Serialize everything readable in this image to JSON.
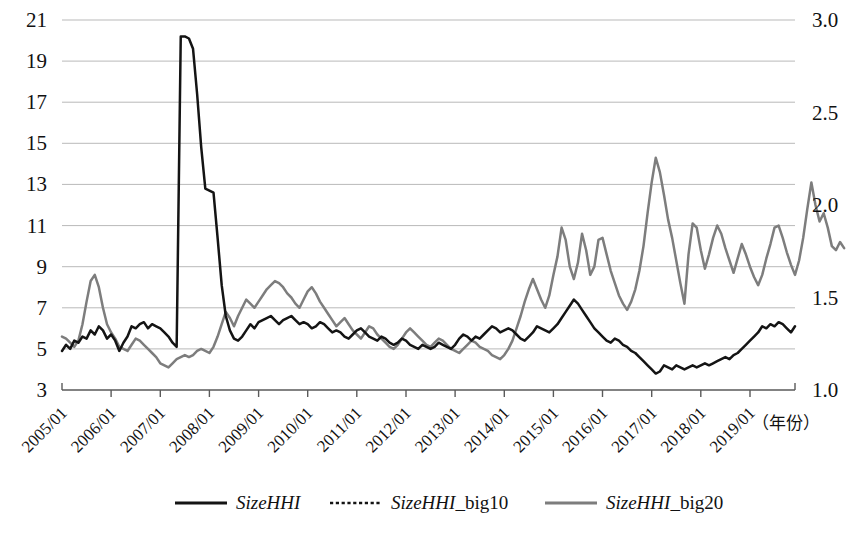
{
  "chart_data": {
    "type": "line",
    "title": "",
    "xlabel": "（年份）",
    "ylabel": "",
    "grid": true,
    "legend_position": "bottom",
    "x_tick_labels": [
      "2005/01",
      "2006/01",
      "2007/01",
      "2008/01",
      "2009/01",
      "2010/01",
      "2011/01",
      "2012/01",
      "2013/01",
      "2014/01",
      "2015/01",
      "2016/01",
      "2017/01",
      "2018/01",
      "2019/01"
    ],
    "left_axis": {
      "label": "",
      "ticks": [
        3,
        5,
        7,
        9,
        11,
        13,
        15,
        17,
        19,
        21
      ],
      "tick_labels": [
        "3",
        "5",
        "7",
        "9",
        "11",
        "13",
        "15",
        "17",
        "19",
        "21"
      ],
      "ylim": [
        3,
        21
      ],
      "applies_to": [
        "SizeHHI",
        "SizeHHI_big20"
      ]
    },
    "right_axis": {
      "label": "",
      "ticks": [
        1.0,
        1.5,
        2.0,
        2.5,
        3.0
      ],
      "tick_labels": [
        "1.0",
        "1.5",
        "2.0",
        "2.5",
        "3.0"
      ],
      "ylim": [
        1.0,
        3.0
      ],
      "applies_to": [
        "SizeHHI_big10"
      ]
    },
    "legend": [
      {
        "name": "SizeHHI",
        "name_italic": "SizeHHI",
        "name_suffix": "",
        "style": "solid",
        "color": "#141414"
      },
      {
        "name": "SizeHHI_big10",
        "name_italic": "SizeHHI",
        "name_suffix": "_big10",
        "style": "dotted",
        "color": "#141414"
      },
      {
        "name": "SizeHHI_big20",
        "name_italic": "SizeHHI",
        "name_suffix": "_big20",
        "style": "solid",
        "color": "#7d7d7d"
      }
    ],
    "x_start": "2005/01",
    "x_end": "2019/12",
    "n_points": 180,
    "series": [
      {
        "name": "SizeHHI",
        "axis": "left",
        "style": "solid",
        "color": "#141414",
        "values": [
          4.9,
          5.2,
          5.0,
          5.4,
          5.3,
          5.6,
          5.5,
          5.9,
          5.7,
          6.1,
          5.9,
          5.5,
          5.7,
          5.4,
          4.9,
          5.3,
          5.6,
          6.1,
          6.0,
          6.2,
          6.3,
          6.0,
          6.2,
          6.1,
          6.0,
          5.8,
          5.6,
          5.3,
          5.1,
          20.2,
          20.2,
          20.1,
          19.6,
          17.4,
          14.8,
          12.8,
          12.7,
          12.6,
          10.4,
          8.1,
          6.6,
          5.9,
          5.5,
          5.4,
          5.6,
          5.9,
          6.2,
          6.0,
          6.3,
          6.4,
          6.5,
          6.6,
          6.4,
          6.2,
          6.4,
          6.5,
          6.6,
          6.4,
          6.2,
          6.3,
          6.2,
          6.0,
          6.1,
          6.3,
          6.2,
          6.0,
          5.8,
          5.9,
          5.8,
          5.6,
          5.5,
          5.7,
          5.9,
          6.0,
          5.8,
          5.6,
          5.5,
          5.4,
          5.6,
          5.5,
          5.3,
          5.2,
          5.3,
          5.5,
          5.4,
          5.2,
          5.1,
          5.0,
          5.2,
          5.1,
          5.0,
          5.1,
          5.3,
          5.2,
          5.1,
          5.0,
          5.2,
          5.5,
          5.7,
          5.6,
          5.4,
          5.6,
          5.5,
          5.7,
          5.9,
          6.1,
          6.0,
          5.8,
          5.9,
          6.0,
          5.9,
          5.7,
          5.5,
          5.4,
          5.6,
          5.8,
          6.1,
          6.0,
          5.9,
          5.8,
          6.0,
          6.2,
          6.5,
          6.8,
          7.1,
          7.4,
          7.2,
          6.9,
          6.6,
          6.3,
          6.0,
          5.8,
          5.6,
          5.4,
          5.3,
          5.5,
          5.4,
          5.2,
          5.1,
          4.9,
          4.8,
          4.6,
          4.4,
          4.2,
          4.0,
          3.8,
          3.9,
          4.2,
          4.1,
          4.0,
          4.2,
          4.1,
          4.0,
          4.1,
          4.2,
          4.1,
          4.2,
          4.3,
          4.2,
          4.3,
          4.4,
          4.5,
          4.6,
          4.5,
          4.7,
          4.8,
          5.0,
          5.2,
          5.4,
          5.6,
          5.8,
          6.1,
          6.0,
          6.2,
          6.1,
          6.3,
          6.2,
          6.0,
          5.8,
          6.1
        ]
      },
      {
        "name": "SizeHHI_big10",
        "axis": "right",
        "style": "dotted",
        "color": "#141414",
        "values": [
          7.0,
          6.6,
          6.3,
          6.2,
          6.5,
          7.1,
          8.0,
          9.3,
          9.6,
          8.6,
          7.4,
          6.6,
          6.3,
          5.9,
          5.4,
          5.2,
          5.1,
          5.3,
          5.0,
          4.8,
          4.9,
          5.1,
          5.0,
          4.8,
          4.7,
          4.6,
          4.5,
          4.6,
          4.8,
          4.9,
          4.8,
          4.7,
          4.9,
          5.0,
          5.2,
          5.1,
          5.0,
          5.4,
          6.2,
          7.3,
          8.6,
          7.4,
          6.6,
          7.8,
          9.0,
          10.4,
          11.7,
          11.9,
          11.4,
          11.0,
          10.9,
          11.3,
          11.8,
          11.4,
          10.6,
          10.0,
          9.6,
          9.2,
          8.9,
          9.4,
          10.3,
          11.0,
          10.3,
          9.6,
          9.4,
          9.8,
          10.5,
          11.0,
          10.4,
          9.7,
          9.0,
          8.4,
          8.0,
          7.6,
          7.3,
          7.1,
          6.9,
          6.7,
          6.5,
          6.4,
          6.2,
          6.1,
          6.0,
          5.9,
          6.2,
          6.4,
          6.1,
          5.9,
          5.7,
          5.6,
          5.5,
          5.4,
          5.3,
          5.2,
          5.1,
          5.3,
          5.5,
          5.8,
          5.6,
          5.4,
          5.3,
          5.2,
          5.1,
          5.0,
          4.9,
          4.8,
          4.6,
          4.3,
          4.6,
          5.0,
          5.4,
          5.6,
          5.5,
          5.4,
          5.6,
          5.8,
          6.0,
          6.2,
          6.4,
          6.8,
          7.3,
          7.8,
          8.2,
          7.6,
          7.2,
          7.6,
          7.1,
          6.8,
          6.5,
          6.3,
          6.1,
          6.4,
          6.7,
          7.0,
          6.6,
          6.2,
          5.9,
          5.4,
          5.0,
          4.7,
          4.4,
          4.8,
          5.3,
          5.9,
          6.6,
          7.6,
          8.9,
          10.1,
          11.4,
          12.6,
          12.3,
          10.5,
          8.6,
          6.8,
          5.5,
          4.7,
          5.0,
          6.1,
          7.5,
          9.3,
          11.1,
          13.0,
          14.9,
          16.0,
          13.2,
          10.2,
          8.0,
          6.4,
          5.8,
          6.6,
          7.5,
          8.7,
          9.6,
          9.0,
          10.4,
          12.5,
          14.8,
          17.2,
          19.5,
          20.9,
          20.6,
          19.4,
          20.4,
          20.9,
          20.2,
          18.9,
          19.8,
          20.8,
          20.4,
          19.6,
          18.7,
          17.8
        ]
      },
      {
        "name": "SizeHHI_big20",
        "axis": "left",
        "style": "solid",
        "color": "#7d7d7d",
        "values": [
          5.6,
          5.5,
          5.3,
          5.1,
          5.4,
          6.2,
          7.3,
          8.3,
          8.6,
          8.0,
          7.0,
          6.2,
          5.8,
          5.5,
          5.1,
          5.0,
          4.9,
          5.2,
          5.5,
          5.4,
          5.2,
          5.0,
          4.8,
          4.6,
          4.3,
          4.2,
          4.1,
          4.3,
          4.5,
          4.6,
          4.7,
          4.6,
          4.7,
          4.9,
          5.0,
          4.9,
          4.8,
          5.1,
          5.6,
          6.2,
          6.8,
          6.5,
          6.1,
          6.6,
          7.0,
          7.4,
          7.2,
          7.0,
          7.3,
          7.6,
          7.9,
          8.1,
          8.3,
          8.2,
          8.0,
          7.7,
          7.5,
          7.2,
          7.0,
          7.4,
          7.8,
          8.0,
          7.7,
          7.3,
          7.0,
          6.7,
          6.4,
          6.1,
          6.3,
          6.5,
          6.2,
          5.9,
          5.7,
          5.5,
          5.8,
          6.1,
          6.0,
          5.7,
          5.5,
          5.3,
          5.1,
          5.0,
          5.2,
          5.5,
          5.8,
          6.0,
          5.8,
          5.6,
          5.4,
          5.2,
          5.1,
          5.3,
          5.5,
          5.4,
          5.2,
          5.0,
          4.9,
          4.8,
          5.0,
          5.2,
          5.4,
          5.3,
          5.1,
          5.0,
          4.9,
          4.7,
          4.6,
          4.5,
          4.7,
          5.0,
          5.4,
          6.0,
          6.6,
          7.3,
          7.9,
          8.4,
          7.9,
          7.4,
          7.0,
          7.6,
          8.6,
          9.5,
          10.9,
          10.3,
          9.0,
          8.4,
          9.2,
          10.6,
          9.8,
          8.6,
          9.0,
          10.3,
          10.4,
          9.6,
          8.8,
          8.2,
          7.6,
          7.2,
          6.9,
          7.3,
          7.9,
          8.8,
          10.0,
          11.6,
          13.1,
          14.3,
          13.6,
          12.5,
          11.3,
          10.4,
          9.3,
          8.2,
          7.2,
          9.6,
          11.1,
          10.9,
          9.8,
          8.9,
          9.6,
          10.4,
          11.0,
          10.6,
          9.9,
          9.3,
          8.7,
          9.4,
          10.1,
          9.6,
          9.0,
          8.5,
          8.1,
          8.6,
          9.4,
          10.1,
          10.9,
          11.0,
          10.4,
          9.7,
          9.1,
          8.6,
          9.3,
          10.4,
          11.8,
          13.1,
          12.0,
          11.2,
          11.6,
          10.9,
          10.0,
          9.8,
          10.2,
          9.9
        ]
      }
    ]
  }
}
